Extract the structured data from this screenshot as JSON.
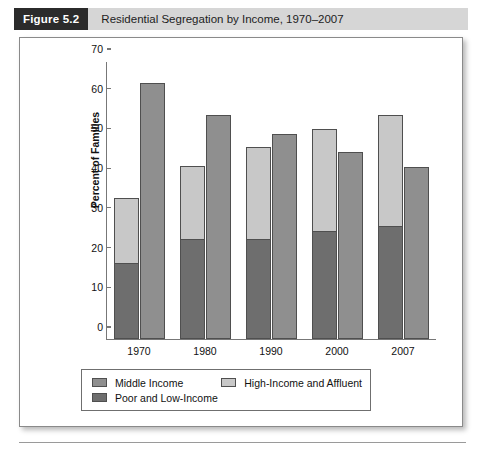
{
  "header": {
    "tag": "Figure 5.2",
    "title": "Residential Segregation by Income, 1970–2007"
  },
  "chart_data": {
    "type": "bar",
    "title": "Residential Segregation by Income, 1970–2007",
    "xlabel": "",
    "ylabel": "Percent of Families",
    "ylim": [
      0,
      70
    ],
    "ytick_step": 10,
    "yticks": [
      0,
      10,
      20,
      30,
      40,
      50,
      60,
      70
    ],
    "grid": false,
    "legend_position": "bottom",
    "categories": [
      "1970",
      "1980",
      "1990",
      "2000",
      "2007"
    ],
    "stacking": "first bar is stacked (Poor and Low-Income bottom, High-Income and Affluent top); second bar is Middle Income",
    "series": [
      {
        "name": "Poor and Low-Income",
        "color": "#6e6e6e",
        "values": [
          19.0,
          25.0,
          25.0,
          27.0,
          28.3
        ]
      },
      {
        "name": "High-Income and Affluent",
        "color": "#c8c8c8",
        "values": [
          16.5,
          18.5,
          23.3,
          25.8,
          28.0
        ],
        "stacked_totals": [
          35.5,
          43.5,
          48.3,
          52.8,
          56.3
        ]
      },
      {
        "name": "Middle Income",
        "color": "#8f8f8f",
        "values": [
          64.5,
          56.5,
          51.7,
          47.0,
          43.3
        ]
      }
    ]
  },
  "legend": {
    "items": [
      {
        "label": "Middle Income",
        "color": "#8f8f8f"
      },
      {
        "label": "High-Income and Affluent",
        "color": "#c8c8c8"
      },
      {
        "label": "Poor and Low-Income",
        "color": "#6e6e6e"
      }
    ]
  }
}
